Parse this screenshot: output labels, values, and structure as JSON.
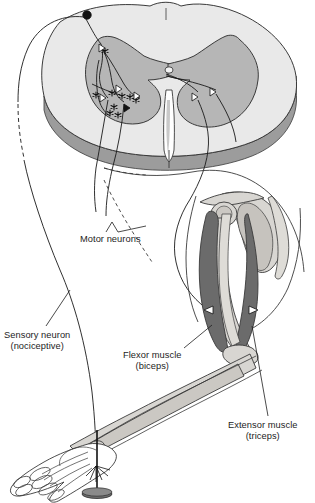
{
  "figure": {
    "background_color": "#ffffff",
    "width": 315,
    "height": 503
  },
  "labels": {
    "motor_neurons": {
      "line1": "Motor neurons",
      "line2": ""
    },
    "sensory_neuron": {
      "line1": "Sensory neuron",
      "line2": "(nociceptive)"
    },
    "flexor_muscle": {
      "line1": "Flexor muscle",
      "line2": "(biceps)"
    },
    "extensor_muscle": {
      "line1": "Extensor muscle",
      "line2": "(triceps)"
    }
  },
  "colors": {
    "outline": "#3a3a3a",
    "white_matter": "#e9e9e9",
    "gray_matter": "#b6b6b6",
    "cord_edge": "#9c9c9c",
    "dark_muscle": "#6b6b6b",
    "bone": "#d8d6d2",
    "bone_shade": "#bdbab4",
    "skin": "#ffffff",
    "neuron_line": "#1a1a1a",
    "text": "#1d1d1d",
    "ghost_text": "#efefef"
  },
  "structures": {
    "spinal_cord": "spinal-cord-cross-section",
    "dorsal_root_ganglion_cell": "sensory-cell-body",
    "synapses": "synapse-star-markers",
    "motor_endings": "arrowhead-markers",
    "interneuron_path": "dashed-nerve-path",
    "arm": "arm-with-muscles-and-bones",
    "hand": "hand-skeleton",
    "stimulus": "tack-pin-noxious-stimulus",
    "scapula": "shoulder-blade",
    "humerus": "upper-arm-bone",
    "forearm_bones": "radius-and-ulna"
  },
  "counts": {
    "synapse_markers": 9,
    "cord_arrowheads": 5,
    "muscle_arrowheads": 2
  }
}
